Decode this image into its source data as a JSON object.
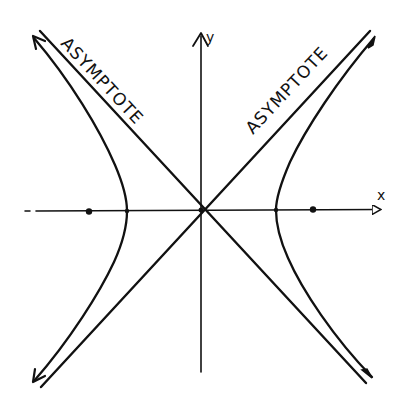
{
  "diagram": {
    "type": "hyperbola",
    "colors": {
      "ink": "#111111",
      "background": "#ffffff"
    },
    "axes": {
      "x_label": "x",
      "y_label": "y"
    },
    "asymptotes": [
      {
        "label": "ASYMPTOTE",
        "direction": "upper-left to lower-right"
      },
      {
        "label": "ASYMPTOTE",
        "direction": "upper-right to lower-left"
      }
    ],
    "branches": [
      "left",
      "right"
    ],
    "foci_count": 2,
    "vertices_count": 2
  }
}
